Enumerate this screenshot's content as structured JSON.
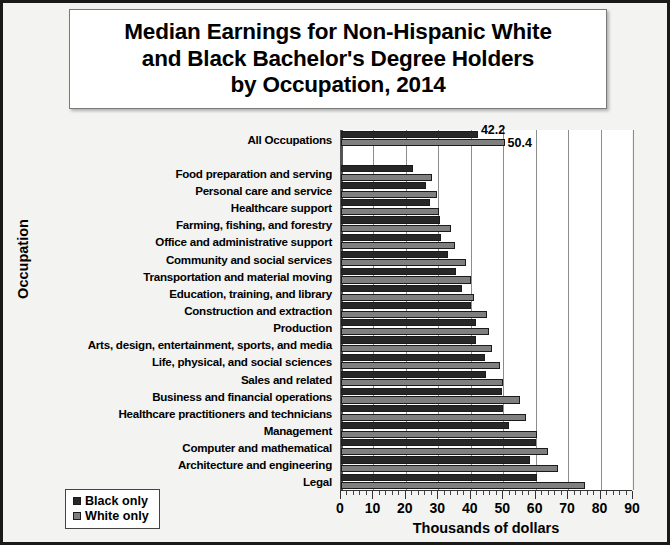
{
  "chart_data": {
    "type": "bar",
    "orientation": "horizontal",
    "title": "Median Earnings for Non-Hispanic White\nand Black Bachelor's Degree Holders\nby Occupation, 2014",
    "xlabel": "Thousands of dollars",
    "ylabel": "Occupation",
    "xlim": [
      0,
      90
    ],
    "xticks": [
      0,
      10,
      20,
      30,
      40,
      50,
      60,
      70,
      80,
      90
    ],
    "xtick_labels": [
      "0",
      "10",
      "20",
      "30",
      "40",
      "50",
      "60",
      "70",
      "80",
      "90"
    ],
    "minor_tick_step": 2,
    "grid": "vertical",
    "legend_position": "bottom-left",
    "categories": [
      "All Occupations",
      "",
      "Food preparation and serving",
      "Personal care and service",
      "Healthcare support",
      "Farming, fishing, and forestry",
      "Office and administrative support",
      "Community and social services",
      "Transportation and material moving",
      "Education, training, and library",
      "Construction and extraction",
      "Production",
      "Arts, design, entertainment, sports, and media",
      "Life, physical, and social sciences",
      "Sales and related",
      "Business and financial operations",
      "Healthcare practitioners and technicians",
      "Management",
      "Computer and mathematical",
      "Architecture and engineering",
      "Legal"
    ],
    "series": [
      {
        "name": "Black only",
        "color": "#272727",
        "values": [
          42.2,
          null,
          22.3,
          26.2,
          27.4,
          30.6,
          30.9,
          33.0,
          35.4,
          37.2,
          40.2,
          41.5,
          41.5,
          44.3,
          44.6,
          49.5,
          49.8,
          51.9,
          60.1,
          58.3,
          60.3
        ]
      },
      {
        "name": "White only",
        "color": "#7f7f7f",
        "values": [
          50.4,
          null,
          27.9,
          29.6,
          30.1,
          34.0,
          35.1,
          38.6,
          40.0,
          40.9,
          45.0,
          45.5,
          46.4,
          49.1,
          50.0,
          55.1,
          57.0,
          60.3,
          63.7,
          67.0,
          75.2
        ]
      }
    ],
    "data_labels": [
      {
        "category": "All Occupations",
        "series": "Black only",
        "value": "42.2"
      },
      {
        "category": "All Occupations",
        "series": "White only",
        "value": "50.4"
      }
    ]
  },
  "legend": {
    "items": [
      {
        "label": "Black only",
        "swatch": "black-only"
      },
      {
        "label": "White only",
        "swatch": "white-only"
      }
    ]
  }
}
